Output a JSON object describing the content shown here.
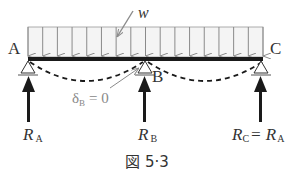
{
  "figure": {
    "caption": "図 5·3",
    "load_label": "w",
    "support_labels": {
      "a": "A",
      "b": "B",
      "c": "C"
    },
    "deflection": {
      "symbol": "δ",
      "subscript": "B",
      "equals": "= 0"
    },
    "reactions": [
      {
        "symbol": "R",
        "subscript": "A",
        "suffix": ""
      },
      {
        "symbol": "R",
        "subscript": "B",
        "suffix": ""
      },
      {
        "symbol": "R",
        "subscript": "C",
        "suffix": "= R",
        "suffix_subscript": "A"
      }
    ],
    "load_arrow_count": 17,
    "colors": {
      "beam": "#1a1a1a",
      "load": "#8a8a8a",
      "load_fill": "#f4f4f4",
      "reaction": "#1a1a1a",
      "label": "#333333",
      "delta_label": "#888888"
    }
  }
}
